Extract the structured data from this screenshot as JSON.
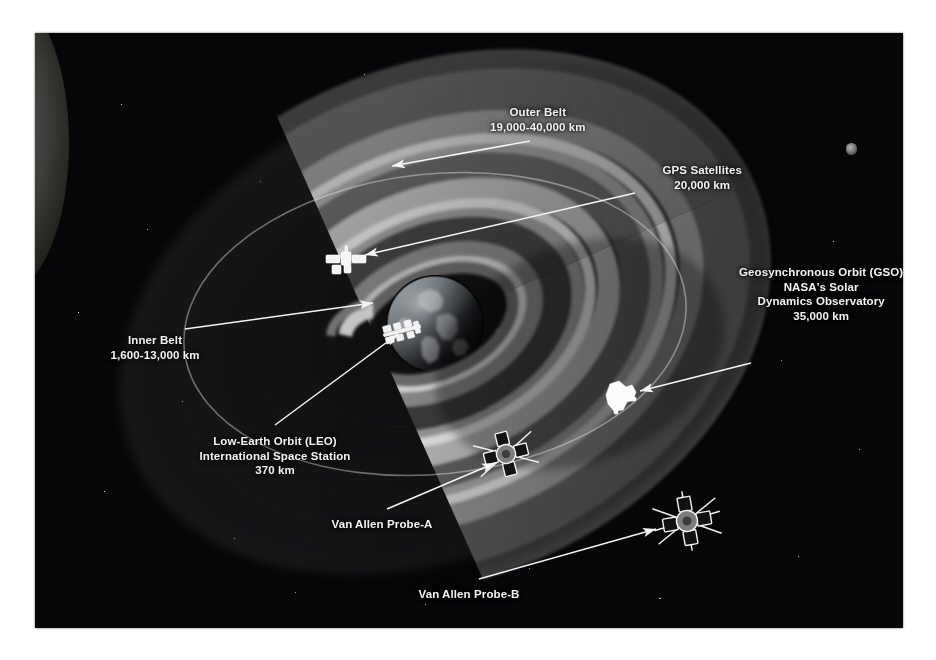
{
  "figure": {
    "background_color": "#050507",
    "border_color": "#ffffff"
  },
  "labels": [
    {
      "id": "outer-belt",
      "name": "Outer Belt",
      "lines": [
        "Outer Belt",
        "19,000-40,000 km"
      ],
      "x": 503,
      "y": 72,
      "align": "center",
      "leader": {
        "x1": 495,
        "y1": 108,
        "x2": 357,
        "y2": 133
      }
    },
    {
      "id": "gps-satellites",
      "name": "GPS Satellites",
      "lines": [
        "GPS Satellites",
        "20,000 km"
      ],
      "x": 667,
      "y": 130,
      "align": "center",
      "leader": {
        "x1": 600,
        "y1": 160,
        "x2": 330,
        "y2": 222
      }
    },
    {
      "id": "geosynchronous-orbit",
      "name": "Geosynchronous Orbit (GSO)",
      "lines": [
        "Geosynchronous Orbit (GSO)",
        "NASA's Solar",
        "Dynamics Observatory",
        "35,000 km"
      ],
      "x": 786,
      "y": 232,
      "align": "center",
      "leader": {
        "x1": 716,
        "y1": 330,
        "x2": 605,
        "y2": 358
      }
    },
    {
      "id": "inner-belt",
      "name": "Inner Belt",
      "lines": [
        "Inner Belt",
        "1,600-13,000 km"
      ],
      "x": 120,
      "y": 300,
      "align": "center",
      "leader": {
        "x1": 150,
        "y1": 296,
        "x2": 338,
        "y2": 270
      }
    },
    {
      "id": "low-earth-orbit",
      "name": "Low-Earth Orbit (LEO) International Space Station",
      "lines": [
        "Low-Earth Orbit (LEO)",
        "International Space Station",
        "370 km"
      ],
      "x": 240,
      "y": 401,
      "align": "center",
      "leader": {
        "x1": 240,
        "y1": 392,
        "x2": 363,
        "y2": 301
      }
    },
    {
      "id": "van-allen-probe-a",
      "name": "Van Allen Probe-A",
      "lines": [
        "Van Allen Probe-A"
      ],
      "x": 347,
      "y": 484,
      "align": "center",
      "leader": {
        "x1": 352,
        "y1": 476,
        "x2": 460,
        "y2": 430
      }
    },
    {
      "id": "van-allen-probe-b",
      "name": "Van Allen Probe-B",
      "lines": [
        "Van Allen Probe-B"
      ],
      "x": 434,
      "y": 554,
      "align": "center",
      "leader": {
        "x1": 444,
        "y1": 546,
        "x2": 621,
        "y2": 496
      }
    }
  ],
  "objects": [
    {
      "id": "earth",
      "name": "Earth",
      "x": 400,
      "y": 291,
      "r": 48
    },
    {
      "id": "gps-satellite",
      "name": "GPS satellite",
      "x": 311,
      "y": 226
    },
    {
      "id": "iss",
      "name": "International Space Station",
      "x": 367,
      "y": 298
    },
    {
      "id": "sdo",
      "name": "Solar Dynamics Observatory",
      "x": 583,
      "y": 363
    },
    {
      "id": "probe-a",
      "name": "Van Allen Probe-A",
      "x": 471,
      "y": 421
    },
    {
      "id": "probe-b",
      "name": "Van Allen Probe-B",
      "x": 652,
      "y": 488
    }
  ],
  "belts": {
    "outer_belt_label": "Outer Belt",
    "inner_belt_label": "Inner Belt",
    "ring_colors": [
      "#4c4c4c",
      "#8e8e8e",
      "#d2d2d2",
      "#686868",
      "#bdbdbd",
      "#e4e4e4"
    ]
  }
}
